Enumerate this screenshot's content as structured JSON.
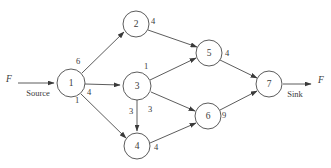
{
  "diagram": {
    "type": "network-flow-graph",
    "source_terminal": {
      "flow_symbol": "F",
      "label": "Source"
    },
    "sink_terminal": {
      "flow_symbol": "F",
      "label": "Sink"
    },
    "nodes": [
      {
        "id": "1",
        "label": "1",
        "cx": 71,
        "cy": 83,
        "r": 14
      },
      {
        "id": "2",
        "label": "2",
        "cx": 136,
        "cy": 24,
        "r": 13
      },
      {
        "id": "3",
        "label": "3",
        "cx": 137,
        "cy": 86,
        "r": 14
      },
      {
        "id": "4",
        "label": "4",
        "cx": 137,
        "cy": 146,
        "r": 13
      },
      {
        "id": "5",
        "label": "5",
        "cx": 209,
        "cy": 53,
        "r": 13
      },
      {
        "id": "6",
        "label": "6",
        "cx": 208,
        "cy": 116,
        "r": 13
      },
      {
        "id": "7",
        "label": "7",
        "cx": 269,
        "cy": 84,
        "r": 13
      }
    ],
    "edges": [
      {
        "from": "1",
        "to": "2",
        "capacity": "6",
        "label_x": 78,
        "label_y": 62
      },
      {
        "from": "1",
        "to": "3",
        "capacity": "4",
        "label_x": 89,
        "label_y": 93
      },
      {
        "from": "1",
        "to": "4",
        "capacity": "1",
        "label_x": 77,
        "label_y": 101
      },
      {
        "from": "2",
        "to": "5",
        "capacity": "4",
        "label_x": 153,
        "label_y": 22
      },
      {
        "from": "3",
        "to": "5",
        "capacity": "1",
        "label_x": 146,
        "label_y": 67
      },
      {
        "from": "3",
        "to": "4",
        "capacity": "3",
        "label_x": 131,
        "label_y": 112
      },
      {
        "from": "3",
        "to": "6",
        "capacity": "3",
        "label_x": 150,
        "label_y": 110
      },
      {
        "from": "4",
        "to": "6",
        "capacity": "4",
        "label_x": 156,
        "label_y": 148
      },
      {
        "from": "5",
        "to": "7",
        "capacity": "4",
        "label_x": 227,
        "label_y": 54
      },
      {
        "from": "6",
        "to": "7",
        "capacity": "9",
        "label_x": 224,
        "label_y": 116
      }
    ]
  }
}
